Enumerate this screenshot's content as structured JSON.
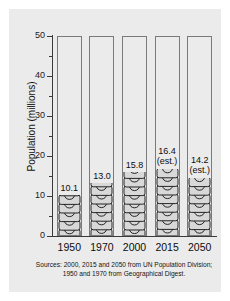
{
  "chart_data": {
    "type": "bar",
    "title": "",
    "subtitle": "",
    "xlabel": "",
    "ylabel": "Population (millions)",
    "categories": [
      "1950",
      "1970",
      "2000",
      "2015",
      "2050"
    ],
    "values": [
      10.1,
      13.0,
      15.8,
      16.4,
      14.2
    ],
    "value_labels": [
      "10.1",
      "13.0",
      "15.8",
      "16.4",
      "14.2"
    ],
    "value_notes": [
      "",
      "",
      "",
      "(est.)",
      "(est.)"
    ],
    "ylim": [
      0,
      50
    ],
    "ytick_labels": [
      "0",
      "10",
      "20",
      "30",
      "40",
      "50"
    ],
    "ytick_values": [
      0,
      10,
      20,
      30,
      40,
      50
    ],
    "yminor_values": [
      5,
      15,
      25,
      35,
      45
    ],
    "grid": false,
    "legend": "none",
    "series": [
      {
        "name": "Population",
        "values": [
          10.1,
          13.0,
          15.8,
          16.4,
          14.2
        ]
      }
    ],
    "annotations": [
      "Sources: 2000, 2015 and 2050 from UN Population Division;",
      "1950 and 1970 from Geographical Digest."
    ],
    "bar_style": "pictogram-people-outline"
  },
  "sources": {
    "line1": "Sources: 2000, 2015 and 2050 from UN Population Division;",
    "line2": "1950 and 1970 from Geographical Digest."
  },
  "colors": {
    "page_background": "#ffffff",
    "panel_background": "#ebebeb",
    "axis": "#3a3a3a",
    "column_outline": "#7a7a7a",
    "pictogram_outline": "#111111",
    "pictogram_fill": "#d8d8d8",
    "text": "#111111"
  }
}
